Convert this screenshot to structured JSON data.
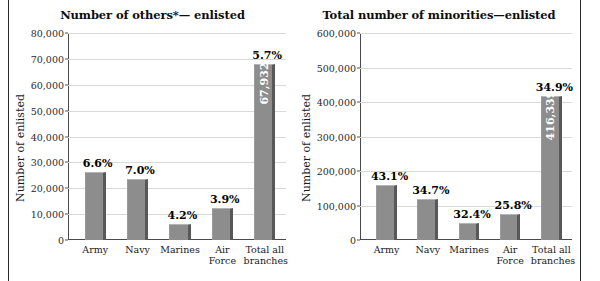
{
  "figure": {
    "background": "#ffffff",
    "rule_color": "#2b2b2b",
    "bar_color": "#8d8d8d",
    "bar_shadow_color": "#585858",
    "grid_color": "#d9d9d9",
    "value_label_color": "#ffffff"
  },
  "chart_data": [
    {
      "type": "bar",
      "title": "Number of others*— enlisted",
      "xlabel": "",
      "ylabel": "Number of enlisted",
      "categories": [
        "Army",
        "Navy",
        "Marines",
        "Air Force",
        "Total all branches"
      ],
      "category_lines": [
        [
          "Army"
        ],
        [
          "Navy"
        ],
        [
          "Marines"
        ],
        [
          "Air",
          "Force"
        ],
        [
          "Total all",
          "branches"
        ]
      ],
      "values": [
        26400,
        23600,
        6200,
        12200,
        67932
      ],
      "percent_labels": [
        "6.6%",
        "7.0%",
        "4.2%",
        "3.9%",
        "5.7%"
      ],
      "value_labels": [
        "",
        "",
        "",
        "",
        "67,932"
      ],
      "ylim": [
        0,
        80000
      ],
      "yticks": [
        0,
        10000,
        20000,
        30000,
        40000,
        50000,
        60000,
        70000,
        80000
      ],
      "ytick_labels": [
        "0",
        "10,000",
        "20,000",
        "30,000",
        "40,000",
        "50,000",
        "60,000",
        "70,000",
        "80,000"
      ],
      "grid": true,
      "legend": "none"
    },
    {
      "type": "bar",
      "title": "Total number of minorities—enlisted",
      "xlabel": "",
      "ylabel": "Number of enlisted",
      "categories": [
        "Army",
        "Navy",
        "Marines",
        "Air Force",
        "Total all branches"
      ],
      "category_lines": [
        [
          "Army"
        ],
        [
          "Navy"
        ],
        [
          "Marines"
        ],
        [
          "Air",
          "Force"
        ],
        [
          "Total all",
          "branches"
        ]
      ],
      "values": [
        160000,
        118000,
        50000,
        75000,
        416339
      ],
      "percent_labels": [
        "43.1%",
        "34.7%",
        "32.4%",
        "25.8%",
        "34.9%"
      ],
      "value_labels": [
        "",
        "",
        "",
        "",
        "416,339"
      ],
      "ylim": [
        0,
        600000
      ],
      "yticks": [
        0,
        100000,
        200000,
        300000,
        400000,
        500000,
        600000
      ],
      "ytick_labels": [
        "0",
        "100,000",
        "200,000",
        "300,000",
        "400,000",
        "500,000",
        "600,000"
      ],
      "grid": true,
      "legend": "none"
    }
  ]
}
